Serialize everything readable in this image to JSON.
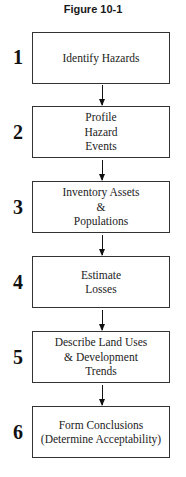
{
  "figure": {
    "title": "Figure 10-1"
  },
  "steps": [
    {
      "number": "1",
      "label": "Identify Hazards"
    },
    {
      "number": "2",
      "label": "Profile\nHazard\nEvents"
    },
    {
      "number": "3",
      "label": "Inventory Assets\n&\nPopulations"
    },
    {
      "number": "4",
      "label": "Estimate\nLosses"
    },
    {
      "number": "5",
      "label": "Describe Land Uses\n& Development\nTrends"
    },
    {
      "number": "6",
      "label": "Form Conclusions\n(Determine Acceptability)"
    }
  ],
  "colors": {
    "border": "#333333",
    "text": "#222222",
    "background": "#ffffff"
  }
}
